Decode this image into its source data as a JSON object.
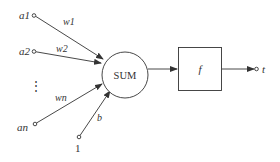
{
  "diagram": {
    "type": "artificial-neuron",
    "colors": {
      "stroke": "#333333",
      "background": "#ffffff"
    },
    "inputs": [
      {
        "label": "a1",
        "weight": "w1"
      },
      {
        "label": "a2",
        "weight": "w2"
      },
      {
        "label": "an",
        "weight": "wn"
      }
    ],
    "ellipsis": "⋮",
    "bias": {
      "input_label": "1",
      "weight": "b"
    },
    "sum_node": {
      "label": "SUM"
    },
    "activation_node": {
      "label": "f"
    },
    "output": {
      "label": "t"
    }
  }
}
